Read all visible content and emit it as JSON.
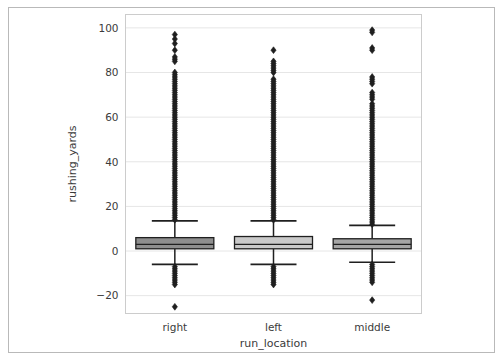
{
  "figure": {
    "width": 503,
    "height": 361,
    "background": "#ffffff",
    "border_color": "#b9b9b9"
  },
  "chart_data": {
    "type": "box",
    "title": "",
    "xlabel": "run_location",
    "ylabel": "rushing_yards",
    "categories": [
      "right",
      "left",
      "middle"
    ],
    "ytick_labels": [
      "100",
      "80",
      "60",
      "40",
      "20",
      "0",
      "−20"
    ],
    "ytick_values": [
      100,
      80,
      60,
      40,
      20,
      0,
      -20
    ],
    "ylim": [
      -28,
      106
    ],
    "grid": "horizontal",
    "legend": "none",
    "axes_color": "#cccccc",
    "grid_color": "#e6e6e6",
    "marker": "diamond",
    "marker_color": "#1f1f1f",
    "boxes": [
      {
        "label": "right",
        "fill": "#8e8e8e",
        "edge": "#1f1f1f",
        "q1": 1,
        "median": 3,
        "q3": 6,
        "whisker_low": -6,
        "whisker_high": 13.5,
        "outlier_max": 97,
        "outlier_min": -25,
        "outliers_high": [
          97,
          95,
          93,
          90,
          87,
          86,
          85,
          80,
          79,
          78,
          77,
          76,
          75,
          74,
          73,
          72,
          71,
          70,
          69,
          68,
          67,
          66,
          65,
          64,
          63,
          62,
          61,
          60,
          59,
          58,
          57,
          56,
          55,
          54,
          53,
          52,
          51,
          50,
          49,
          48,
          47,
          46,
          45,
          44,
          43,
          42,
          41,
          40,
          39,
          38,
          37,
          36,
          35,
          34,
          33,
          32,
          31,
          30,
          29,
          28,
          27,
          26,
          25,
          24,
          23,
          22,
          21,
          20,
          19,
          18,
          17,
          16,
          15,
          14
        ],
        "outliers_low": [
          -7,
          -8,
          -9,
          -10,
          -11,
          -12,
          -13,
          -14,
          -15,
          -25
        ]
      },
      {
        "label": "left",
        "fill": "#c9c9c9",
        "edge": "#1f1f1f",
        "q1": 1,
        "median": 3,
        "q3": 6.5,
        "whisker_low": -6,
        "whisker_high": 13.5,
        "outlier_max": 90,
        "outlier_min": -15,
        "outliers_high": [
          90,
          85,
          84,
          83,
          82,
          81,
          80,
          77,
          76,
          75,
          74,
          73,
          72,
          71,
          70,
          69,
          68,
          67,
          66,
          65,
          64,
          63,
          62,
          61,
          60,
          59,
          58,
          57,
          56,
          55,
          54,
          53,
          52,
          51,
          50,
          49,
          48,
          47,
          46,
          45,
          44,
          43,
          42,
          41,
          40,
          39,
          38,
          37,
          36,
          35,
          34,
          33,
          32,
          31,
          30,
          29,
          28,
          27,
          26,
          25,
          24,
          23,
          22,
          21,
          20,
          19,
          18,
          17,
          16,
          15,
          14
        ],
        "outliers_low": [
          -7,
          -8,
          -9,
          -10,
          -11,
          -12,
          -13,
          -14,
          -15
        ]
      },
      {
        "label": "middle",
        "fill": "#a6a6a6",
        "edge": "#1f1f1f",
        "q1": 1,
        "median": 3,
        "q3": 5.5,
        "whisker_low": -5,
        "whisker_high": 11.5,
        "outlier_max": 99,
        "outlier_min": -22,
        "outliers_high": [
          99,
          98,
          91,
          90,
          78,
          77,
          76,
          75,
          71,
          70,
          69,
          68,
          66,
          65,
          64,
          63,
          62,
          61,
          60,
          59,
          58,
          57,
          56,
          55,
          54,
          53,
          52,
          51,
          50,
          49,
          48,
          47,
          46,
          45,
          44,
          43,
          42,
          41,
          40,
          39,
          38,
          37,
          36,
          35,
          34,
          33,
          32,
          31,
          30,
          29,
          28,
          27,
          26,
          25,
          24,
          23,
          22,
          21,
          20,
          19,
          18,
          17,
          16,
          15,
          14,
          13,
          12
        ],
        "outliers_low": [
          -6,
          -7,
          -8,
          -9,
          -10,
          -11,
          -12,
          -13,
          -14,
          -22
        ]
      }
    ]
  }
}
